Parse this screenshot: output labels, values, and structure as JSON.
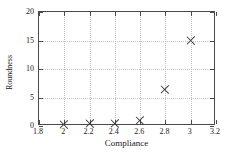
{
  "chart_data": {
    "type": "scatter",
    "title": "",
    "xlabel": "Compliance",
    "ylabel": "Roundness",
    "xlim": [
      1.8,
      3.2
    ],
    "ylim": [
      0,
      20
    ],
    "xticks": [
      1.8,
      2,
      2.2,
      2.4,
      2.6,
      2.8,
      3,
      3.2
    ],
    "xtick_labels": [
      "1.8",
      "2",
      "2.2",
      "2.4",
      "2.6",
      "2.8",
      "3",
      "3.2"
    ],
    "yticks": [
      0,
      5,
      10,
      15,
      20
    ],
    "ytick_labels": [
      "0",
      "5",
      "10",
      "15",
      "20"
    ],
    "grid": true,
    "grid_style": "dotted",
    "grid_color": "#c2c2c2",
    "legend": null,
    "marker": "x",
    "marker_color": "#3a3a3a",
    "frame_color": "#4a4a4a",
    "x": [
      2,
      2.2,
      2.4,
      2.6,
      2.8,
      3
    ],
    "y": [
      0.3,
      0.4,
      0.5,
      1.0,
      6.4,
      15.0
    ],
    "points": [
      {
        "x": 2,
        "y": 0.3
      },
      {
        "x": 2.2,
        "y": 0.4
      },
      {
        "x": 2.4,
        "y": 0.5
      },
      {
        "x": 2.6,
        "y": 1.0
      },
      {
        "x": 2.8,
        "y": 6.4
      },
      {
        "x": 3,
        "y": 15.0
      }
    ]
  }
}
